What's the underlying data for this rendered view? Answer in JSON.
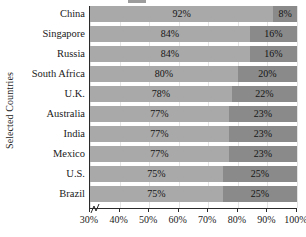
{
  "chart_data": {
    "type": "bar",
    "orientation": "horizontal",
    "stacked": true,
    "title": "",
    "xlabel": "",
    "ylabel": "Selected Countries",
    "xlim": [
      30,
      100
    ],
    "axis_break": true,
    "grid": true,
    "legend_position": "top",
    "categories": [
      "China",
      "Singapore",
      "Russia",
      "South Africa",
      "U.K.",
      "Australia",
      "India",
      "Mexico",
      "U.S.",
      "Brazil"
    ],
    "xtick_labels": [
      "30%",
      "40%",
      "50%",
      "60%",
      "70%",
      "80%",
      "90%",
      "100%"
    ],
    "xtick_values": [
      30,
      40,
      50,
      60,
      70,
      80,
      90,
      100
    ],
    "series": [
      {
        "name": "first",
        "values": [
          92,
          84,
          84,
          80,
          78,
          77,
          77,
          77,
          75,
          75
        ],
        "labels": [
          "92%",
          "84%",
          "84%",
          "80%",
          "78%",
          "77%",
          "77%",
          "77%",
          "75%",
          "75%"
        ],
        "color": "#a9a9a9"
      },
      {
        "name": "second",
        "values": [
          8,
          16,
          16,
          20,
          22,
          23,
          23,
          23,
          25,
          25
        ],
        "labels": [
          "8%",
          "16%",
          "16%",
          "20%",
          "22%",
          "23%",
          "23%",
          "23%",
          "25%",
          "25%"
        ],
        "color": "#8a8a8a"
      }
    ]
  },
  "legend": {
    "swatch_color": "#9d9d9d",
    "label": ""
  },
  "axis": {
    "y_title": "Selected Countries"
  }
}
